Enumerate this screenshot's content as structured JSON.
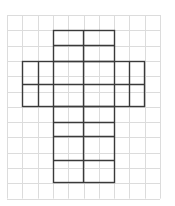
{
  "diagram": {
    "type": "grid-net",
    "grid": {
      "left": 7,
      "top": 15,
      "cols": 10,
      "rows": 12,
      "cell": 15.3,
      "color": "#dcdcdc"
    },
    "outline_color": "#3a3a3a",
    "rectangles": [
      {
        "name": "top-flap",
        "x1": 53,
        "y1": 30,
        "x2": 114,
        "y2": 61
      },
      {
        "name": "cross-arm",
        "x1": 22,
        "y1": 61,
        "x2": 144,
        "y2": 106
      },
      {
        "name": "stem",
        "x1": 53,
        "y1": 106,
        "x2": 114,
        "y2": 182
      }
    ],
    "segments": [
      [
        53,
        45,
        114,
        45
      ],
      [
        83,
        30,
        83,
        182
      ],
      [
        38,
        61,
        38,
        106
      ],
      [
        53,
        61,
        53,
        106
      ],
      [
        114,
        61,
        114,
        106
      ],
      [
        129,
        61,
        129,
        106
      ],
      [
        22,
        84,
        144,
        84
      ],
      [
        53,
        122,
        114,
        122
      ],
      [
        53,
        136,
        114,
        136
      ],
      [
        53,
        160,
        114,
        160
      ]
    ]
  }
}
